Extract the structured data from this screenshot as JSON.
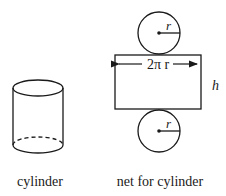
{
  "diagram": {
    "cylinder": {
      "caption": "cylinder"
    },
    "net": {
      "caption": "net for cylinder",
      "top_circle_radius_label": "r",
      "bottom_circle_radius_label": "r",
      "rectangle_width_label": "2π r",
      "rectangle_height_label": "h"
    }
  },
  "colors": {
    "stroke": "#1a1a1a",
    "background": "#ffffff"
  }
}
